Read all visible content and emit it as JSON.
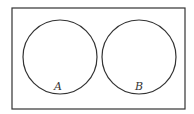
{
  "diagram": {
    "type": "venn",
    "universe": {
      "x": 12,
      "y": 8,
      "width": 173,
      "height": 101
    },
    "sets": [
      {
        "label": "A",
        "cx": 60,
        "cy": 57,
        "r": 37,
        "label_x": 58,
        "label_y": 90
      },
      {
        "label": "B",
        "cx": 139,
        "cy": 57,
        "r": 37,
        "label_x": 139,
        "label_y": 90
      }
    ],
    "stroke_color": "#333333"
  }
}
